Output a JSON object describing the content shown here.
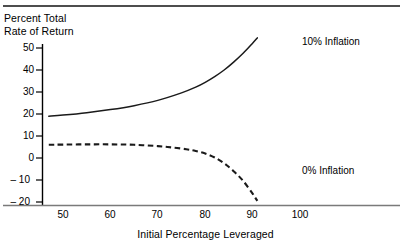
{
  "chart_data": {
    "type": "line",
    "title": "",
    "ylabel": "Percent Total\nRate of Return",
    "xlabel": "Initial Percentage Leveraged",
    "xlim": [
      46,
      106
    ],
    "ylim": [
      -20,
      55
    ],
    "grid": false,
    "legend_position": "inline-right",
    "xticks": [
      50,
      60,
      70,
      80,
      90,
      100
    ],
    "xtick_labels": [
      "50",
      "60",
      "70",
      "80",
      "90",
      "100"
    ],
    "yticks": [
      -20,
      -10,
      0,
      10,
      20,
      30,
      40,
      50
    ],
    "ytick_labels": [
      "– 20",
      "– 10",
      "0",
      "10",
      "20",
      "30",
      "40",
      "50"
    ],
    "series": [
      {
        "name": "10% Inflation",
        "style": "solid",
        "label_text": "10% Inflation",
        "x": [
          47,
          50,
          55,
          60,
          65,
          70,
          75,
          78,
          80,
          82,
          84,
          86,
          88,
          90,
          91
        ],
        "values": [
          19,
          19.5,
          20.6,
          22.0,
          23.8,
          26.2,
          29.6,
          32.2,
          34.4,
          37.0,
          40.0,
          43.6,
          47.6,
          52.2,
          54.6
        ]
      },
      {
        "name": "0% Inflation",
        "style": "dashed",
        "label_text": "0% Inflation",
        "x": [
          47,
          50,
          55,
          60,
          65,
          70,
          73,
          76,
          78,
          80,
          82,
          84,
          86,
          88,
          90,
          91
        ],
        "values": [
          6.0,
          6.1,
          6.2,
          6.2,
          6.0,
          5.4,
          4.8,
          4.0,
          3.2,
          2.0,
          0.2,
          -2.4,
          -6.0,
          -10.4,
          -16.2,
          -19.5
        ]
      }
    ]
  }
}
